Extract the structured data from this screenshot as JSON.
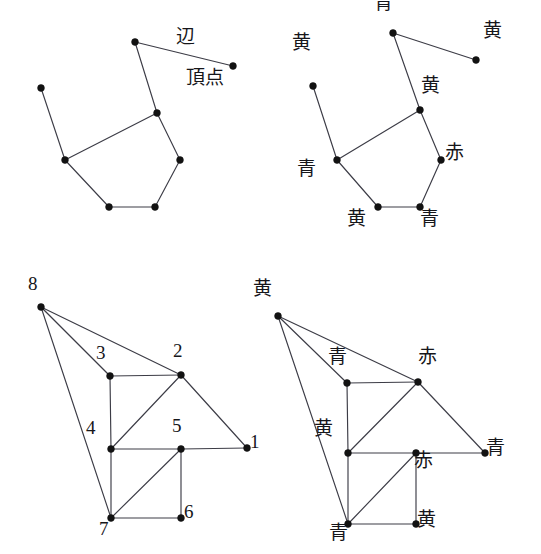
{
  "figure": {
    "background_color": "#ffffff",
    "edge_color": "#3c3c46",
    "vertex_color": "#121212",
    "text_color": "#16161a"
  },
  "glossary": {
    "edge_term": "辺",
    "vertex_term": "頂点"
  },
  "colors": {
    "blue": "青",
    "yellow": "黄",
    "red": "赤"
  },
  "panels": [
    {
      "id": "top-left",
      "name": "plain-graph-with-terms",
      "vertices": [
        {
          "id": "a",
          "x": 135,
          "y": 42,
          "label": "",
          "label_dx": 0,
          "label_dy": 0
        },
        {
          "id": "b",
          "x": 233,
          "y": 66,
          "label": "",
          "label_dx": 0,
          "label_dy": 0
        },
        {
          "id": "c",
          "x": 41,
          "y": 88,
          "label": "",
          "label_dx": 0,
          "label_dy": 0
        },
        {
          "id": "d",
          "x": 157,
          "y": 113,
          "label": "",
          "label_dx": 0,
          "label_dy": 0
        },
        {
          "id": "e",
          "x": 65,
          "y": 160,
          "label": "",
          "label_dx": 0,
          "label_dy": 0
        },
        {
          "id": "f",
          "x": 180,
          "y": 160,
          "label": "",
          "label_dx": 0,
          "label_dy": 0
        },
        {
          "id": "g",
          "x": 109,
          "y": 207,
          "label": "",
          "label_dx": 0,
          "label_dy": 0
        },
        {
          "id": "h",
          "x": 155,
          "y": 207,
          "label": "",
          "label_dx": 0,
          "label_dy": 0
        }
      ],
      "edges": [
        [
          "a",
          "b"
        ],
        [
          "a",
          "d"
        ],
        [
          "c",
          "e"
        ],
        [
          "d",
          "e"
        ],
        [
          "d",
          "f"
        ],
        [
          "e",
          "g"
        ],
        [
          "g",
          "h"
        ],
        [
          "h",
          "f"
        ]
      ],
      "annotations": [
        {
          "name": "edge-term-label",
          "text": "辺",
          "x": 176,
          "y": 27
        },
        {
          "name": "vertex-term-label",
          "text": "頂点",
          "x": 186,
          "y": 68
        }
      ]
    },
    {
      "id": "top-right",
      "name": "colored-graph",
      "vertices": [
        {
          "id": "a",
          "x": 393,
          "y": 33,
          "label": "青",
          "label_dx": -10,
          "label_dy": -31
        },
        {
          "id": "b",
          "x": 476,
          "y": 60,
          "label": "黄",
          "label_dx": 16,
          "label_dy": -30
        },
        {
          "id": "c",
          "x": 313,
          "y": 86,
          "label": "黄",
          "label_dx": -12,
          "label_dy": -44
        },
        {
          "id": "d",
          "x": 420,
          "y": 110,
          "label": "黄",
          "label_dx": 10,
          "label_dy": -25
        },
        {
          "id": "e",
          "x": 337,
          "y": 160,
          "label": "青",
          "label_dx": -31,
          "label_dy": 8
        },
        {
          "id": "f",
          "x": 441,
          "y": 160,
          "label": "赤",
          "label_dx": 13,
          "label_dy": -8
        },
        {
          "id": "g",
          "x": 378,
          "y": 207,
          "label": "黄",
          "label_dx": -22,
          "label_dy": 11
        },
        {
          "id": "h",
          "x": 420,
          "y": 207,
          "label": "青",
          "label_dx": 9,
          "label_dy": 11
        }
      ],
      "edges": [
        [
          "a",
          "b"
        ],
        [
          "a",
          "d"
        ],
        [
          "c",
          "e"
        ],
        [
          "d",
          "e"
        ],
        [
          "d",
          "f"
        ],
        [
          "e",
          "g"
        ],
        [
          "g",
          "h"
        ],
        [
          "h",
          "f"
        ]
      ],
      "annotations": []
    },
    {
      "id": "bottom-left",
      "name": "numbered-graph",
      "vertices": [
        {
          "id": "8",
          "x": 41,
          "y": 307,
          "label": "8",
          "label_dx": -8,
          "label_dy": -26
        },
        {
          "id": "3",
          "x": 110,
          "y": 376,
          "label": "3",
          "label_dx": -9,
          "label_dy": -26
        },
        {
          "id": "2",
          "x": 181,
          "y": 375,
          "label": "2",
          "label_dx": -3,
          "label_dy": -27
        },
        {
          "id": "4",
          "x": 111,
          "y": 449,
          "label": "4",
          "label_dx": -20,
          "label_dy": -24
        },
        {
          "id": "5",
          "x": 181,
          "y": 449,
          "label": "5",
          "label_dx": -4,
          "label_dy": -26
        },
        {
          "id": "1",
          "x": 247,
          "y": 448,
          "label": "1",
          "label_dx": 8,
          "label_dy": -9
        },
        {
          "id": "7",
          "x": 111,
          "y": 518,
          "label": "7",
          "label_dx": -7,
          "label_dy": 8
        },
        {
          "id": "6",
          "x": 181,
          "y": 518,
          "label": "6",
          "label_dx": 8,
          "label_dy": -9
        }
      ],
      "edges": [
        [
          "8",
          "2"
        ],
        [
          "8",
          "3"
        ],
        [
          "8",
          "7"
        ],
        [
          "3",
          "2"
        ],
        [
          "3",
          "4"
        ],
        [
          "2",
          "4"
        ],
        [
          "2",
          "1"
        ],
        [
          "4",
          "5"
        ],
        [
          "4",
          "7"
        ],
        [
          "5",
          "1"
        ],
        [
          "5",
          "7"
        ],
        [
          "5",
          "6"
        ],
        [
          "7",
          "6"
        ]
      ],
      "annotations": []
    },
    {
      "id": "bottom-right",
      "name": "numbered-graph-colored",
      "vertices": [
        {
          "id": "8",
          "x": 278,
          "y": 316,
          "label": "黄",
          "label_dx": -16,
          "label_dy": -28
        },
        {
          "id": "3",
          "x": 347,
          "y": 383,
          "label": "青",
          "label_dx": -10,
          "label_dy": -27
        },
        {
          "id": "2",
          "x": 418,
          "y": 382,
          "label": "赤",
          "label_dx": 9,
          "label_dy": -26
        },
        {
          "id": "4",
          "x": 348,
          "y": 453,
          "label": "黄",
          "label_dx": -25,
          "label_dy": -25
        },
        {
          "id": "5",
          "x": 416,
          "y": 453,
          "label": "赤",
          "label_dx": 7,
          "label_dy": 7
        },
        {
          "id": "1",
          "x": 485,
          "y": 453,
          "label": "青",
          "label_dx": 10,
          "label_dy": -6
        },
        {
          "id": "7",
          "x": 348,
          "y": 524,
          "label": "青",
          "label_dx": -10,
          "label_dy": 8
        },
        {
          "id": "6",
          "x": 416,
          "y": 524,
          "label": "黄",
          "label_dx": 10,
          "label_dy": -5
        }
      ],
      "edges": [
        [
          "8",
          "2"
        ],
        [
          "8",
          "3"
        ],
        [
          "8",
          "7"
        ],
        [
          "3",
          "2"
        ],
        [
          "3",
          "4"
        ],
        [
          "2",
          "4"
        ],
        [
          "2",
          "1"
        ],
        [
          "4",
          "5"
        ],
        [
          "4",
          "7"
        ],
        [
          "5",
          "1"
        ],
        [
          "5",
          "7"
        ],
        [
          "5",
          "6"
        ],
        [
          "7",
          "6"
        ]
      ],
      "annotations": []
    }
  ]
}
